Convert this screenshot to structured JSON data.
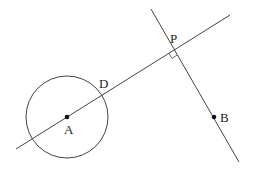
{
  "diagram": {
    "type": "geometry",
    "colors": {
      "stroke": "#444444",
      "point": "#111111",
      "background": "#ffffff"
    },
    "circle": {
      "center": "A",
      "cx": 67,
      "cy": 117,
      "r": 41
    },
    "points": {
      "A": {
        "label": "A",
        "x": 67,
        "y": 117,
        "label_x": 64,
        "label_y": 134
      },
      "B": {
        "label": "B",
        "x": 214,
        "y": 117,
        "label_x": 220,
        "label_y": 122
      },
      "P": {
        "label": "P",
        "x": 174,
        "y": 50,
        "label_x": 170,
        "label_y": 43
      },
      "D": {
        "label": "D",
        "x": 101,
        "y": 95,
        "label_x": 99,
        "label_y": 88
      }
    },
    "lines": [
      {
        "name": "line-AP",
        "x1": 16,
        "y1": 149,
        "x2": 230,
        "y2": 15
      },
      {
        "name": "line-PB-perpendicular",
        "x1": 151,
        "y1": 9,
        "x2": 239,
        "y2": 162
      }
    ],
    "right_angle_marker": {
      "at": "P"
    }
  }
}
